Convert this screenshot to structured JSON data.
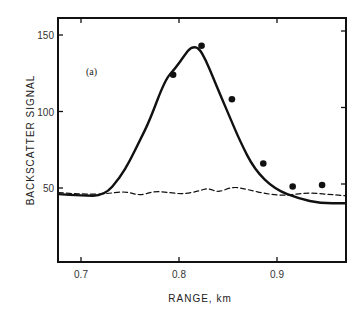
{
  "chart_data": {
    "type": "line",
    "title": "",
    "annotation": "(a)",
    "xlabel": "RANGE, km",
    "ylabel": "BACKSCATTER SIGNAL",
    "xlim": [
      0.677,
      0.97
    ],
    "ylim": [
      14,
      161
    ],
    "xticks": [
      0.7,
      0.8,
      0.9
    ],
    "xtick_labels": [
      "0.7",
      "0.8",
      "0.9"
    ],
    "yticks": [
      50,
      100,
      150
    ],
    "ytick_labels": [
      "50",
      "100",
      "150"
    ],
    "grid": false,
    "legend": null,
    "series": [
      {
        "name": "solid curve",
        "style": "solid",
        "x": [
          0.677,
          0.7,
          0.724,
          0.74,
          0.75,
          0.76,
          0.77,
          0.786,
          0.796,
          0.806,
          0.812,
          0.82,
          0.827,
          0.835,
          0.842,
          0.852,
          0.862,
          0.877,
          0.898,
          0.923,
          0.944,
          0.969
        ],
        "y": [
          46,
          45,
          45,
          57,
          68,
          81,
          94,
          121,
          128,
          137,
          142,
          142,
          134,
          122,
          111,
          96,
          81,
          62,
          49,
          43,
          40,
          40
        ]
      },
      {
        "name": "dashed curve",
        "style": "dashed",
        "x": [
          0.677,
          0.7,
          0.724,
          0.745,
          0.76,
          0.775,
          0.79,
          0.805,
          0.82,
          0.83,
          0.84,
          0.855,
          0.87,
          0.89,
          0.91,
          0.93,
          0.95,
          0.969
        ],
        "y": [
          47,
          46,
          46,
          48,
          45,
          48,
          47,
          46,
          48,
          50,
          47,
          51,
          49,
          46,
          45,
          47,
          46,
          45
        ]
      },
      {
        "name": "measured points",
        "style": "markers",
        "x": [
          0.794,
          0.823,
          0.854,
          0.886,
          0.916,
          0.946
        ],
        "y": [
          124,
          143,
          108,
          66,
          51,
          52
        ]
      }
    ]
  }
}
